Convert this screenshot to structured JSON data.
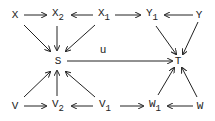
{
  "diagram": {
    "nodes": {
      "X": {
        "label": "X",
        "sub": ""
      },
      "X2": {
        "label": "X",
        "sub": "2"
      },
      "X1": {
        "label": "X",
        "sub": "1"
      },
      "Y1": {
        "label": "Y",
        "sub": "1"
      },
      "Y": {
        "label": "Y",
        "sub": ""
      },
      "S": {
        "label": "S",
        "sub": ""
      },
      "T": {
        "label": "T",
        "sub": ""
      },
      "V": {
        "label": "V",
        "sub": ""
      },
      "V2": {
        "label": "V",
        "sub": "2"
      },
      "V1": {
        "label": "V",
        "sub": "1"
      },
      "W1": {
        "label": "W",
        "sub": "1"
      },
      "W": {
        "label": "W",
        "sub": ""
      }
    },
    "edge_label_u": "u",
    "edges": [
      [
        "X",
        "X2"
      ],
      [
        "X1",
        "X2"
      ],
      [
        "X1",
        "Y1"
      ],
      [
        "Y",
        "Y1"
      ],
      [
        "X",
        "S"
      ],
      [
        "X2",
        "S"
      ],
      [
        "X1",
        "S"
      ],
      [
        "Y1",
        "T"
      ],
      [
        "Y",
        "T"
      ],
      [
        "S",
        "T"
      ],
      [
        "V",
        "S"
      ],
      [
        "V2",
        "S"
      ],
      [
        "V1",
        "S"
      ],
      [
        "W1",
        "T"
      ],
      [
        "W",
        "T"
      ],
      [
        "V",
        "V2"
      ],
      [
        "V1",
        "V2"
      ],
      [
        "V1",
        "W1"
      ],
      [
        "W",
        "W1"
      ]
    ]
  }
}
